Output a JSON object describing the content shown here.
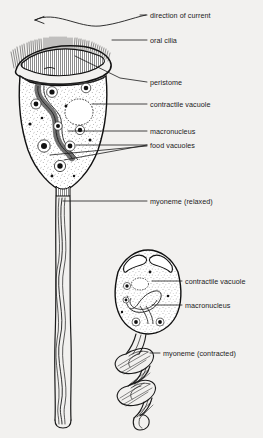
{
  "figure": {
    "background_color": "#f2f1ef",
    "ink_color": "#1b1b1b"
  },
  "labels": [
    {
      "id": "direction-of-current",
      "text": "direction of current",
      "x": 150,
      "y": 17
    },
    {
      "id": "oral-cilia",
      "text": "oral cilia",
      "x": 150,
      "y": 42
    },
    {
      "id": "peristome",
      "text": "peristome",
      "x": 150,
      "y": 85
    },
    {
      "id": "contractile-vacuole-1",
      "text": "contractile vacuole",
      "x": 150,
      "y": 106
    },
    {
      "id": "macronucleus-1",
      "text": "macronucleus",
      "x": 150,
      "y": 133
    },
    {
      "id": "food-vacuoles",
      "text": "food vacuoles",
      "x": 150,
      "y": 147
    },
    {
      "id": "myoneme-relaxed",
      "text": "myoneme (relaxed)",
      "x": 150,
      "y": 203
    },
    {
      "id": "contractile-vacuole-2",
      "text": "contractile vacuole",
      "x": 185,
      "y": 283
    },
    {
      "id": "macronucleus-2",
      "text": "macronucleus",
      "x": 185,
      "y": 307
    },
    {
      "id": "myoneme-contracted",
      "text": "myoneme (contracted)",
      "x": 163,
      "y": 355
    }
  ],
  "parts": {
    "extended_organism": "Vorticella with expanded bell and straight stalk",
    "contracted_organism": "Vorticella with closed bell and coiled stalk",
    "arrow": "curved arrow pointing left above the oral cilia"
  }
}
